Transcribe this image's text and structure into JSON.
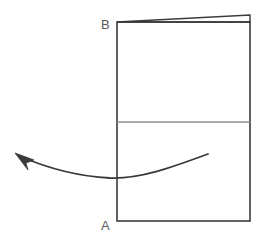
{
  "diagram": {
    "type": "line-drawing",
    "background_color": "#ffffff",
    "stroke_color": "#3a3a3a",
    "divider_color": "#8f8f8f",
    "label_color": "#5a5a5a",
    "labels": {
      "top_left": "B",
      "bottom_left": "A"
    },
    "shapes": {
      "rectangle": {
        "name": "main-rectangle",
        "x": 117,
        "y": 22,
        "width": 133,
        "height": 199,
        "stroke_width": 1.6
      },
      "divider": {
        "name": "horizontal-divider",
        "x1": 117,
        "y1": 122,
        "x2": 250,
        "y2": 122,
        "stroke_width": 1.2
      },
      "wedge": {
        "name": "top-sliver-wedge",
        "points": "117,22 250,15 250,22",
        "stroke_width": 1.4
      },
      "arrow": {
        "name": "curved-arrow",
        "path": "M 208 154 C 170 168, 140 179, 110 178 C 75 176, 45 167, 22 157",
        "stroke_width": 1.8,
        "head_points": "16,154 32,159 25,163 27,168"
      }
    }
  }
}
